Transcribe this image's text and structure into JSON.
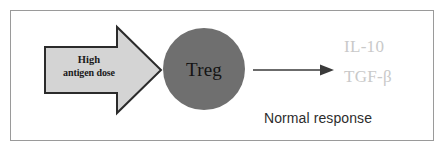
{
  "figure": {
    "background_color": "#ffffff",
    "border_color": "#9a9a9a",
    "width": 446,
    "height": 153
  },
  "block_arrow": {
    "fill_color": "#d4d4d4",
    "stroke_color": "#2b2b2b",
    "line_1": "High",
    "line_2": "antigen dose",
    "direction": "right"
  },
  "cell": {
    "label": "Treg",
    "fill_color": "#6f6f6f",
    "text_color": "#141414",
    "shape": "circle"
  },
  "connector": {
    "direction": "right",
    "color": "#3a3a3a"
  },
  "outputs": {
    "color": "#c9c9c9",
    "items": [
      {
        "label": "IL-10"
      },
      {
        "label": "TGF-β"
      }
    ]
  },
  "caption": {
    "text": "Normal response",
    "color": "#2d2d2d"
  }
}
